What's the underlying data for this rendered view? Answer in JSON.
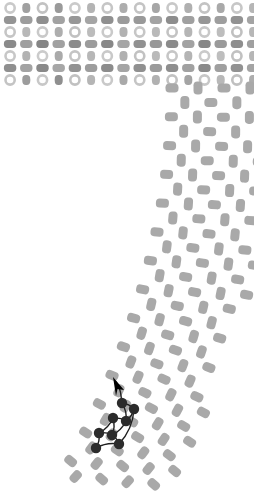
{
  "canvas": {
    "width": 254,
    "height": 494,
    "background": "#ffffff",
    "title": "abstract-patterned-shape-with-trajectory-overlay"
  },
  "palette": {
    "ring_stroke": "#b2b2b2",
    "ring_fill": "#ffffff",
    "cell_light": "#c9c9c9",
    "cell_mid": "#a8a8a8",
    "cell_dark": "#8e8e8e",
    "cell_darker": "#767676",
    "tail_fill": "#a9a9a9",
    "node_fill": "#2b2b2b",
    "path_stroke": "#1e1e1e",
    "arrow_fill": "#1e1e1e"
  },
  "head_block": {
    "x": 2,
    "y": 2,
    "width": 250,
    "height": 84,
    "rows": 7,
    "row_height": 12,
    "col_step": 16.2,
    "cols": 16,
    "description": "dense head grid of alternating ring rows and filled capsule rows",
    "row_types": [
      "ring",
      "bar",
      "ring",
      "bar",
      "ring",
      "bar",
      "ring"
    ],
    "row_shades": [
      [
        "#c9c9c9",
        "#a0a0a0",
        "#c2c2c2",
        "#9a9a9a",
        "#cacaca",
        "#b4b4b4",
        "#c6c6c6",
        "#adadad",
        "#c4c4c4",
        "#a6a6a6",
        "#c8c8c8",
        "#b0b0b0",
        "#c3c3c3",
        "#a9a9a9",
        "#c7c7c7",
        "#b6b6b6"
      ],
      [
        "#949494",
        "#9d9d9d",
        "#8f8f8f",
        "#a2a2a2",
        "#979797",
        "#a5a5a5",
        "#909090",
        "#9b9b9b",
        "#999999",
        "#a3a3a3",
        "#8d8d8d",
        "#a0a0a0",
        "#969696",
        "#9e9e9e",
        "#929292",
        "#a4a4a4"
      ],
      [
        "#c5c5c5",
        "#b8b8b8",
        "#c9c9c9",
        "#aeaeae",
        "#c1c1c1",
        "#bcbcbc",
        "#cacaca",
        "#b2b2b2",
        "#c6c6c6",
        "#b9b9b9",
        "#c3c3c3",
        "#b5b5b5",
        "#c8c8c8",
        "#bdbdbd",
        "#c0c0c0",
        "#b7b7b7"
      ],
      [
        "#8a8a8a",
        "#9f9f9f",
        "#858585",
        "#a1a1a1",
        "#8c8c8c",
        "#9c9c9c",
        "#888888",
        "#a6a6a6",
        "#919191",
        "#989898",
        "#8b8b8b",
        "#a2a2a2",
        "#878787",
        "#9a9a9a",
        "#8e8e8e",
        "#a0a0a0"
      ],
      [
        "#c7c7c7",
        "#b3b3b3",
        "#cbcbcb",
        "#aaaaaa",
        "#c4c4c4",
        "#b7b7b7",
        "#c9c9c9",
        "#b0b0b0",
        "#c2c2c2",
        "#bababa",
        "#c6c6c6",
        "#b4b4b4",
        "#cacaca",
        "#bebebe",
        "#c1c1c1",
        "#b6b6b6"
      ],
      [
        "#8f8f8f",
        "#a3a3a3",
        "#898989",
        "#a7a7a7",
        "#939393",
        "#9d9d9d",
        "#8c8c8c",
        "#a5a5a5",
        "#909090",
        "#9b9b9b",
        "#8e8e8e",
        "#a1a1a1",
        "#8a8a8a",
        "#9f9f9f",
        "#929292",
        "#a4a4a4"
      ],
      [
        "#c4c4c4",
        "#9c9c9c",
        "#c8c8c8",
        "#8f8f8f",
        "#c1c1c1",
        "#b5b5b5",
        "#c9c9c9",
        "#a9a9a9",
        "#c5c5c5",
        "#b1b1b1",
        "#c2c2c2",
        "#a4a4a4",
        "#c7c7c7",
        "#b8b8b8",
        "#c0c0c0",
        "#adadad"
      ]
    ]
  },
  "tail": {
    "description": "vertical band of rounded capsules that progressively rotates counter-clockwise and sweeps toward the lower-left",
    "top_y": 88,
    "bottom_y": 492,
    "left_start": 172,
    "right_edge": 252,
    "rows": 28,
    "row_step": 14.4,
    "col_step": 26,
    "fill": "#a9a9a9",
    "capsule_long": 13,
    "capsule_short": 9,
    "rotation_start_deg": 0,
    "rotation_end_deg": 42,
    "drift_per_row": 3.1
  },
  "trajectory": {
    "description": "dark node-and-edge path overlay with an arrowhead pointing up-left",
    "node_count": 8,
    "node_radius": 5.2,
    "node_fill": "#2b2b2b",
    "stroke": "#1e1e1e",
    "stroke_width": 1.4,
    "nodes": [
      {
        "x": 122,
        "y": 403
      },
      {
        "x": 134,
        "y": 409
      },
      {
        "x": 113,
        "y": 418
      },
      {
        "x": 126,
        "y": 421
      },
      {
        "x": 99,
        "y": 433
      },
      {
        "x": 112,
        "y": 435
      },
      {
        "x": 96,
        "y": 448
      },
      {
        "x": 119,
        "y": 444
      }
    ],
    "arrow_tip": {
      "x": 113,
      "y": 377
    },
    "arrow_angle_deg": -68
  },
  "layers": [
    {
      "name": "head-grid",
      "label": "head grid"
    },
    {
      "name": "tail-band",
      "label": "tail band"
    },
    {
      "name": "trajectory-overlay",
      "label": "trajectory overlay"
    }
  ]
}
